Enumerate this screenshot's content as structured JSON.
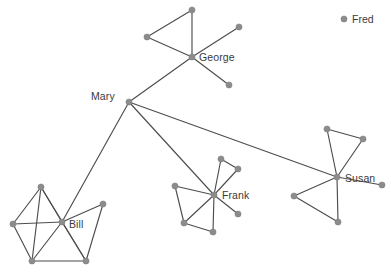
{
  "figure": {
    "type": "node-link-network-graph",
    "width": 391,
    "height": 275,
    "background_color": "#ffffff",
    "node_color": "#8c8c8c",
    "edge_color": "#4d4d4d",
    "label_color": "#3a3a3a"
  },
  "labels": {
    "george": "George",
    "mary": "Mary",
    "bill": "Bill",
    "frank": "Frank",
    "susan": "Susan",
    "fred": "Fred"
  },
  "chart_data": {
    "type": "scatter",
    "title": "",
    "xlabel": "",
    "ylabel": "",
    "grid": false,
    "legend_position": "top-right",
    "named_nodes": [
      {
        "id": "george",
        "label": "George",
        "x": 192,
        "y": 57,
        "degree": 5
      },
      {
        "id": "mary",
        "label": "Mary",
        "x": 129,
        "y": 102,
        "degree": 4
      },
      {
        "id": "bill",
        "label": "Bill",
        "x": 62,
        "y": 222,
        "degree": 8
      },
      {
        "id": "frank",
        "label": "Frank",
        "x": 214,
        "y": 195,
        "degree": 8
      },
      {
        "id": "susan",
        "label": "Susan",
        "x": 337,
        "y": 177,
        "degree": 7
      },
      {
        "id": "fred",
        "label": "Fred",
        "x": 344,
        "y": 19,
        "degree": 0
      }
    ],
    "unnamed_nodes": [
      {
        "id": "g1",
        "x": 192,
        "y": 10
      },
      {
        "id": "g2",
        "x": 147,
        "y": 37
      },
      {
        "id": "g3",
        "x": 239,
        "y": 27
      },
      {
        "id": "g4",
        "x": 229,
        "y": 85
      },
      {
        "id": "b1",
        "x": 41,
        "y": 187
      },
      {
        "id": "b2",
        "x": 13,
        "y": 224
      },
      {
        "id": "b3",
        "x": 32,
        "y": 261
      },
      {
        "id": "b4",
        "x": 86,
        "y": 261
      },
      {
        "id": "b5",
        "x": 103,
        "y": 204
      },
      {
        "id": "f1",
        "x": 221,
        "y": 159
      },
      {
        "id": "f2",
        "x": 238,
        "y": 169
      },
      {
        "id": "f3",
        "x": 175,
        "y": 186
      },
      {
        "id": "f4",
        "x": 184,
        "y": 223
      },
      {
        "id": "f5",
        "x": 213,
        "y": 232
      },
      {
        "id": "f6",
        "x": 238,
        "y": 214
      },
      {
        "id": "s1",
        "x": 327,
        "y": 129
      },
      {
        "id": "s2",
        "x": 363,
        "y": 139
      },
      {
        "id": "s3",
        "x": 382,
        "y": 185
      },
      {
        "id": "s4",
        "x": 294,
        "y": 196
      },
      {
        "id": "s5",
        "x": 338,
        "y": 222
      }
    ],
    "edges": [
      [
        "george",
        "g1"
      ],
      [
        "george",
        "g2"
      ],
      [
        "george",
        "g3"
      ],
      [
        "george",
        "g4"
      ],
      [
        "g1",
        "g2"
      ],
      [
        "george",
        "mary"
      ],
      [
        "mary",
        "bill"
      ],
      [
        "mary",
        "frank"
      ],
      [
        "mary",
        "susan"
      ],
      [
        "bill",
        "b1"
      ],
      [
        "bill",
        "b2"
      ],
      [
        "bill",
        "b3"
      ],
      [
        "bill",
        "b4"
      ],
      [
        "bill",
        "b5"
      ],
      [
        "b1",
        "b2"
      ],
      [
        "b1",
        "b3"
      ],
      [
        "b1",
        "b4"
      ],
      [
        "b2",
        "b3"
      ],
      [
        "b3",
        "b4"
      ],
      [
        "b4",
        "b5"
      ],
      [
        "frank",
        "f1"
      ],
      [
        "frank",
        "f2"
      ],
      [
        "frank",
        "f3"
      ],
      [
        "frank",
        "f4"
      ],
      [
        "frank",
        "f5"
      ],
      [
        "frank",
        "f6"
      ],
      [
        "f1",
        "f2"
      ],
      [
        "f3",
        "f4"
      ],
      [
        "f4",
        "f5"
      ],
      [
        "susan",
        "s1"
      ],
      [
        "susan",
        "s2"
      ],
      [
        "susan",
        "s3"
      ],
      [
        "susan",
        "s4"
      ],
      [
        "susan",
        "s5"
      ],
      [
        "s1",
        "s2"
      ],
      [
        "s4",
        "s5"
      ]
    ]
  }
}
